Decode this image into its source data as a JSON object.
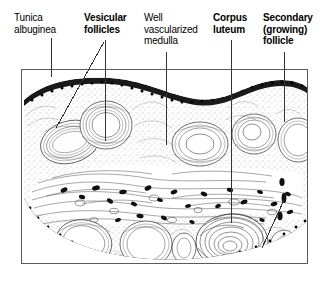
{
  "figure": {
    "frame": {
      "x": 21,
      "y": 69,
      "width": 287,
      "height": 195,
      "border_color": "#5a5a5a"
    },
    "background_color": "#ffffff",
    "ink_color": "#000000"
  },
  "labels": [
    {
      "id": "tunica-albuginea",
      "text": "Tunica\nalbuginea",
      "weight": "regular",
      "x": 14,
      "y": 12,
      "leader": [
        {
          "x": 51,
          "y": 38,
          "to_x": 51,
          "to_y": 77
        }
      ]
    },
    {
      "id": "vesicular-follicles",
      "text": "Vesicular\nfollicles",
      "weight": "bold",
      "x": 84,
      "y": 12,
      "leader": [
        {
          "x": 105,
          "y": 40,
          "to_x": 105,
          "to_y": 141
        },
        {
          "x": 104,
          "y": 42,
          "to_x": 56,
          "to_y": 128
        }
      ]
    },
    {
      "id": "well-vascularized-medulla",
      "text": "Well\nvascularized\nmedulla",
      "weight": "regular",
      "x": 144,
      "y": 12,
      "leader": [
        {
          "x": 166,
          "y": 52,
          "to_x": 166,
          "to_y": 145
        }
      ]
    },
    {
      "id": "corpus-luteum",
      "text": "Corpus\nluteum",
      "weight": "bold",
      "x": 213,
      "y": 12,
      "leader": [
        {
          "x": 231,
          "y": 40,
          "to_x": 231,
          "to_y": 223
        }
      ]
    },
    {
      "id": "secondary-growing-follicle",
      "text": "Secondary\n(growing)\nfollicle",
      "weight": "bold",
      "x": 263,
      "y": 12,
      "leader": [
        {
          "x": 284,
          "y": 52,
          "to_x": 284,
          "to_y": 122
        }
      ]
    }
  ],
  "structures": {
    "tunica_albuginea": "dense dark capsule along the outer surface",
    "cortex": "stippled pale region containing follicles",
    "medulla": "central region with dark blood vessel profiles",
    "vesicular_follicles": "large antral cavities with clear centers",
    "corpus_luteum": "large convoluted swirled glandular mass",
    "secondary_follicle": "growing follicle with small antrum"
  }
}
